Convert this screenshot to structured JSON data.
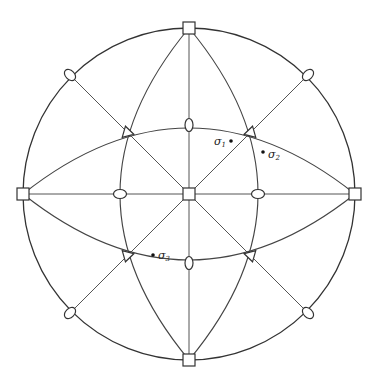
{
  "diagram": {
    "type": "stereographic-projection",
    "center": [
      189,
      194
    ],
    "radius": 166,
    "squares": [
      {
        "name": "top",
        "x": 189,
        "y": 28
      },
      {
        "name": "bottom",
        "x": 189,
        "y": 360
      },
      {
        "name": "left",
        "x": 23,
        "y": 194
      },
      {
        "name": "right",
        "x": 355,
        "y": 194
      },
      {
        "name": "center",
        "x": 189,
        "y": 194
      }
    ],
    "ellipses": [
      {
        "name": "inner-top",
        "x": 189,
        "y": 125
      },
      {
        "name": "inner-bottom",
        "x": 189,
        "y": 263
      },
      {
        "name": "inner-left",
        "x": 120,
        "y": 194
      },
      {
        "name": "inner-right",
        "x": 258,
        "y": 194
      },
      {
        "name": "outer-top-left",
        "x": 70,
        "y": 75
      },
      {
        "name": "outer-top-right",
        "x": 308,
        "y": 75
      },
      {
        "name": "outer-bottom-left",
        "x": 70,
        "y": 313
      },
      {
        "name": "outer-bottom-right",
        "x": 308,
        "y": 313
      }
    ],
    "triangles": [
      {
        "name": "upper-left",
        "x": 127,
        "y": 132
      },
      {
        "name": "upper-right",
        "x": 251,
        "y": 132
      },
      {
        "name": "lower-left",
        "x": 127,
        "y": 256
      },
      {
        "name": "lower-right",
        "x": 251,
        "y": 256
      }
    ],
    "labels": {
      "sigma1": {
        "base": "σ",
        "sub": "1",
        "dot": [
          231,
          141
        ],
        "text": [
          214,
          145
        ]
      },
      "sigma2": {
        "base": "σ",
        "sub": "2",
        "dot": [
          263,
          152
        ],
        "text": [
          268,
          158
        ]
      },
      "sigma3": {
        "base": "σ",
        "sub": "3",
        "dot": [
          153,
          255
        ],
        "text": [
          158,
          259
        ]
      }
    }
  }
}
